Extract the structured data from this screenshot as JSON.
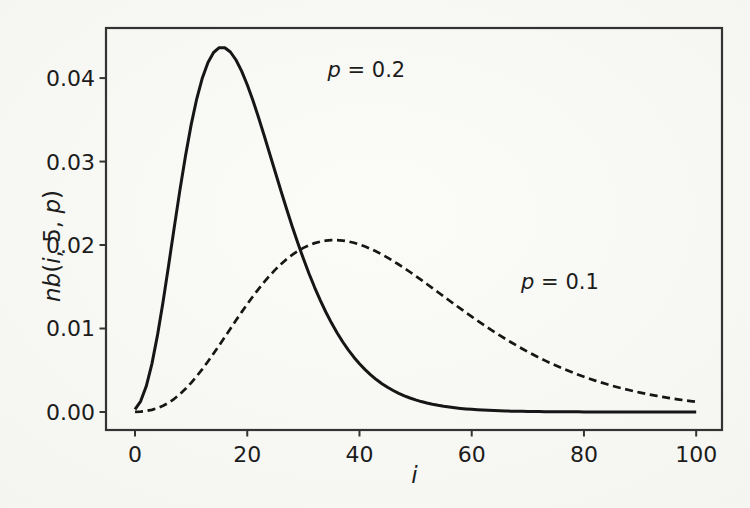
{
  "figure": {
    "background_color": "#f5f5f1",
    "axis_color": "#333333",
    "ink_color": "#161616"
  },
  "chart_data": {
    "type": "line",
    "title": "",
    "xlabel": "i",
    "ylabel": "nb(i, 5, p)",
    "xlim": [
      -5.17,
      104.6
    ],
    "ylim": [
      -0.00216,
      0.046
    ],
    "grid": false,
    "legend": "none",
    "xticks": {
      "values": [
        0,
        20,
        40,
        60,
        80,
        100
      ],
      "labels": [
        "0",
        "20",
        "40",
        "60",
        "80",
        "100"
      ]
    },
    "yticks": {
      "values": [
        0,
        0.01,
        0.02,
        0.03,
        0.04
      ],
      "labels": [
        "0.00",
        "0.01",
        "0.02",
        "0.03",
        "0.04"
      ]
    },
    "x_start": 0,
    "x_step": 1,
    "series": [
      {
        "name": "p = 0.2",
        "style": "solid",
        "values": [
          0.00032,
          0.00128,
          0.003072,
          0.005734,
          0.009175,
          0.013212,
          0.017616,
          0.022146,
          0.026575,
          0.030709,
          0.034394,
          0.037521,
          0.040022,
          0.041869,
          0.043066,
          0.04364,
          0.04364,
          0.043126,
          0.042168,
          0.040837,
          0.039203,
          0.037336,
          0.0353,
          0.033151,
          0.030941,
          0.028713,
          0.026504,
          0.024345,
          0.022258,
          0.020263,
          0.018371,
          0.016594,
          0.014934,
          0.013396,
          0.011977,
          0.010677,
          0.00949,
          0.008413,
          0.007439,
          0.006562,
          0.005774,
          0.00507,
          0.004442,
          0.003884,
          0.00339,
          0.002953,
          0.002568,
          0.002229,
          0.001932,
          0.001672,
          0.001444,
          0.001246,
          0.001074,
          0.000924,
          0.000794,
          0.000681,
          0.000584,
          0.0005,
          0.000427,
          0.000365,
          0.000312,
          0.000266,
          0.000226,
          0.000192,
          0.000164,
          0.000139,
          0.000118,
          0.0001,
          8.5e-05,
          7.2e-05,
          6.1e-05,
          5.1e-05,
          4.3e-05,
          3.6e-05,
          3.1e-05,
          2.6e-05,
          2.2e-05,
          1.8e-05,
          1.5e-05,
          1.3e-05,
          1.1e-05,
          9e-06,
          8e-06,
          6e-06,
          5e-06,
          5e-06,
          4e-06,
          3e-06,
          3e-06,
          2e-06,
          2e-06,
          2e-06,
          1e-06,
          1e-06,
          1e-06,
          1e-06,
          1e-06,
          1e-06,
          0,
          0,
          0
        ]
      },
      {
        "name": "p = 0.1",
        "style": "dashed",
        "values": [
          1e-05,
          4.5e-05,
          0.000122,
          0.000255,
          0.000459,
          0.000744,
          0.001116,
          0.001578,
          0.002131,
          0.00277,
          0.00349,
          0.004284,
          0.00514,
          0.00605,
          0.007,
          0.00798,
          0.008978,
          0.009981,
          0.010979,
          0.011962,
          0.012919,
          0.013841,
          0.014722,
          0.015554,
          0.016332,
          0.017051,
          0.017707,
          0.018297,
          0.01882,
          0.019274,
          0.019659,
          0.019976,
          0.020226,
          0.02041,
          0.02053,
          0.020589,
          0.020589,
          0.020533,
          0.020425,
          0.020268,
          0.020065,
          0.01982,
          0.019537,
          0.019219,
          0.01887,
          0.018492,
          0.01809,
          0.017667,
          0.017225,
          0.016768,
          0.016299,
          0.015819,
          0.015333,
          0.014841,
          0.014346,
          0.013851,
          0.013356,
          0.012864,
          0.012376,
          0.011893,
          0.011418,
          0.01095,
          0.010491,
          0.010041,
          0.009602,
          0.009173,
          0.008756,
          0.008351,
          0.007958,
          0.007578,
          0.00721,
          0.006854,
          0.006511,
          0.006181,
          0.005864,
          0.005559,
          0.005267,
          0.004986,
          0.004718,
          0.004461,
          0.004215,
          0.003981,
          0.003758,
          0.003545,
          0.003343,
          0.00315,
          0.002967,
          0.002793,
          0.002628,
          0.002471,
          0.002323,
          0.002183,
          0.00205,
          0.001924,
          0.001805,
          0.001693,
          0.001587,
          0.001488,
          0.001394,
          0.001305,
          0.001221
        ]
      }
    ],
    "annotations": [
      {
        "text": "p = 0.2",
        "x": 34.3,
        "y": 0.0401
      },
      {
        "text": "p = 0.1",
        "x": 68.8,
        "y": 0.0147
      }
    ]
  }
}
